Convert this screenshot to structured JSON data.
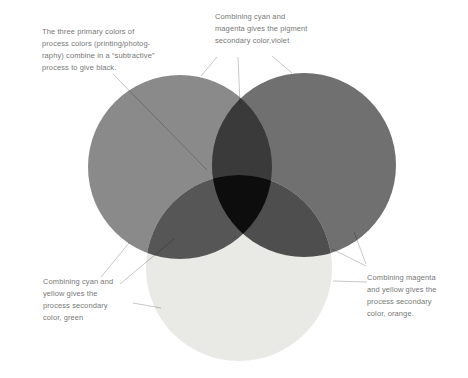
{
  "colors": {
    "background": "#ffffff",
    "cyan_circle": "#8a8a8a",
    "magenta_circle": "#707070",
    "yellow_circle": "#e9e9e5",
    "violet_overlap": "#3a3a3a",
    "green_overlap": "#565656",
    "orange_overlap": "#4e4e4e",
    "black_center": "#0d0d0d",
    "annotation_text": "#787878",
    "leader_line": "rgba(0,0,0,0.28)"
  },
  "diagram": {
    "circles": [
      {
        "name": "cyan-primary-circle",
        "display_color": "#8a8a8a"
      },
      {
        "name": "magenta-primary-circle",
        "display_color": "#707070"
      },
      {
        "name": "yellow-primary-circle",
        "display_color": "#e9e9e5"
      }
    ],
    "overlap_regions": [
      {
        "name": "violet-secondary",
        "display_color": "#3a3a3a"
      },
      {
        "name": "green-secondary",
        "display_color": "#565656"
      },
      {
        "name": "orange-secondary",
        "display_color": "#4e4e4e"
      },
      {
        "name": "black-subtractive-center",
        "display_color": "#0d0d0d"
      }
    ]
  },
  "annotations": {
    "black": {
      "lines": [
        "The three primary colors of",
        "process colors (printing/photog-",
        "raphy) combine in a “subtractive”",
        "process to give black."
      ]
    },
    "violet": {
      "lines": [
        "Combining cyan and",
        "magenta gives the pigment",
        "secondary color,violet"
      ]
    },
    "green": {
      "lines": [
        "Combining cyan and",
        "yellow gives the",
        "process secondary",
        "color, green"
      ]
    },
    "orange": {
      "lines": [
        "Combining magenta",
        "and yellow gives the",
        "process secondary",
        "color, orange."
      ]
    }
  }
}
